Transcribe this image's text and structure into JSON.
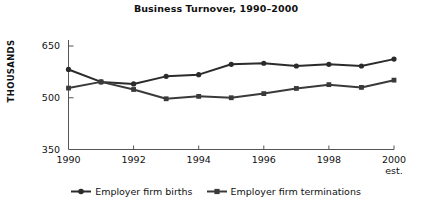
{
  "chart_data": {
    "type": "line",
    "title": "Business Turnover, 1990–2000",
    "xlabel": "",
    "ylabel": "THOUSANDS",
    "ylim": [
      350,
      650
    ],
    "yticks": [
      350,
      500,
      650
    ],
    "ytick_labels": [
      "350",
      "500",
      "650"
    ],
    "grid": false,
    "legend_position": "bottom",
    "x": [
      1990,
      1991,
      1992,
      1993,
      1994,
      1995,
      1996,
      1997,
      1998,
      1999,
      2000
    ],
    "xticks": [
      1990,
      1992,
      1994,
      1996,
      1998,
      2000
    ],
    "xtick_labels": [
      "1990",
      "1992",
      "1994",
      "1996",
      "1998",
      "2000"
    ],
    "x_annotation": "est.",
    "x_annotation_at": 2000,
    "series": [
      {
        "name": "Employer firm births",
        "marker": "circle",
        "color": "#2b2b2b",
        "values": [
          582,
          546,
          540,
          562,
          567,
          597,
          600,
          592,
          597,
          592,
          612
        ]
      },
      {
        "name": "Employer firm terminations",
        "marker": "square",
        "color": "#3a3a3a",
        "values": [
          528,
          546,
          524,
          497,
          504,
          500,
          512,
          527,
          538,
          530,
          551
        ]
      }
    ]
  },
  "legend": {
    "entries": [
      {
        "label": "Employer firm births",
        "marker": "circle"
      },
      {
        "label": "Employer firm terminations",
        "marker": "square"
      }
    ]
  },
  "colors": {
    "line": "#2b2b2b",
    "axis": "#555555",
    "background": "#ffffff",
    "text": "#111111"
  }
}
